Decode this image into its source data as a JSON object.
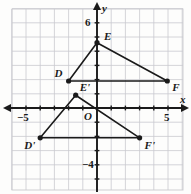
{
  "figure": {
    "type": "coordinate-graph",
    "title": "",
    "axes": {
      "x_label": "x",
      "y_label": "y",
      "origin_label": "O",
      "x_ticks": [
        {
          "value": -5,
          "label": "−5"
        },
        {
          "value": 5,
          "label": "5"
        }
      ],
      "y_ticks": [
        {
          "value": 6,
          "label": "6"
        },
        {
          "value": -4,
          "label": "−4"
        }
      ],
      "xlim": [
        -6,
        6
      ],
      "ylim": [
        -5.5,
        6.5
      ],
      "grid": true,
      "grid_step": 1
    },
    "colors": {
      "grid": "#c9c9cf",
      "axis": "#1a1a1a",
      "shape": "#1a1a1a",
      "text": "#1a1a1a",
      "background": "#fdfdfc"
    },
    "points": [
      {
        "name": "E",
        "label": "E",
        "x": 0,
        "y": 4.6,
        "label_dx": 7,
        "label_dy": -12
      },
      {
        "name": "D",
        "label": "D",
        "x": -2,
        "y": 1.9,
        "label_dx": -14,
        "label_dy": -13
      },
      {
        "name": "F",
        "label": "F",
        "x": 4.95,
        "y": 1.9,
        "label_dx": 5,
        "label_dy": 1
      },
      {
        "name": "Ep",
        "label": "E'",
        "x": -1.5,
        "y": 0.9,
        "label_dx": 4,
        "label_dy": -13
      },
      {
        "name": "Dp",
        "label": "D'",
        "x": -4,
        "y": -2.1,
        "label_dx": -16,
        "label_dy": 2
      },
      {
        "name": "Fp",
        "label": "F'",
        "x": 3,
        "y": -2.1,
        "label_dx": 5,
        "label_dy": 2
      }
    ],
    "shapes": [
      {
        "name": "triangle-DEF",
        "vertices": [
          "D",
          "E",
          "F"
        ],
        "closed": true
      },
      {
        "name": "triangle-DpEpFp",
        "vertices": [
          "Dp",
          "Ep",
          "Fp"
        ],
        "closed": true
      }
    ]
  }
}
